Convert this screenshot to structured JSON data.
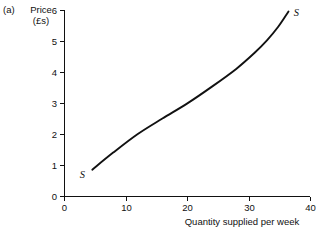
{
  "figure": {
    "panel_letter": "(a)",
    "y_axis_title_line1": "Price",
    "y_axis_title_line2": "(£s)",
    "x_axis_title": "Quantity supplied per week"
  },
  "chart_data": {
    "type": "line",
    "title": "",
    "subtitle": "",
    "xlabel": "Quantity supplied per week",
    "ylabel": "Price (£s)",
    "xlim": [
      0,
      40
    ],
    "ylim": [
      0,
      6
    ],
    "x_ticks": [
      0,
      10,
      20,
      30,
      40
    ],
    "x_tick_labels": [
      "0",
      "10",
      "20",
      "30",
      "40"
    ],
    "y_ticks": [
      0,
      1,
      2,
      3,
      4,
      5,
      6
    ],
    "y_tick_labels": [
      "0",
      "1",
      "2",
      "3",
      "4",
      "5",
      "6"
    ],
    "grid": false,
    "legend": "none",
    "annotations": [
      {
        "text": "S",
        "x": 3.0,
        "y": 0.72,
        "note": "lower-left end label of supply curve"
      },
      {
        "text": "S",
        "x": 37.8,
        "y": 5.95,
        "note": "upper-right end label of supply curve"
      }
    ],
    "series": [
      {
        "name": "S",
        "style": "solid-black-curve",
        "x": [
          4.6,
          8.0,
          12.0,
          16.0,
          20.0,
          24.0,
          28.0,
          31.0,
          33.0,
          34.8,
          36.5
        ],
        "y": [
          0.85,
          1.4,
          2.0,
          2.5,
          2.98,
          3.52,
          4.1,
          4.62,
          5.02,
          5.45,
          5.95
        ]
      }
    ]
  },
  "axis_geometry": {
    "origin_px": [
      64,
      196
    ],
    "x_end_px": [
      310,
      196
    ],
    "y_top_px": [
      64,
      10
    ],
    "px_per_x_unit": 6.15,
    "px_per_y_unit": 31.0
  },
  "colors": {
    "background": "#ffffff",
    "ink": "#111111",
    "curve": "#111111"
  }
}
